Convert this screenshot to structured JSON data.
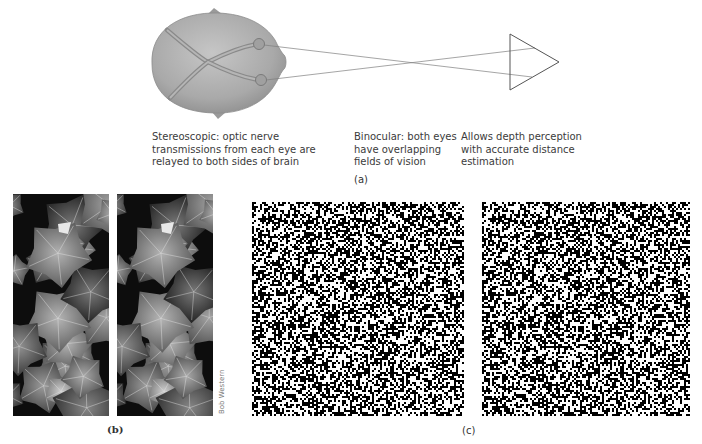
{
  "figure": {
    "panel_a": {
      "label": "(a)",
      "captions": {
        "stereoscopic": [
          "Stereoscopic: optic nerve",
          "transmissions from each eye are",
          "relayed to both sides of brain"
        ],
        "binocular": [
          "Binocular: both eyes",
          "have overlapping",
          "fields of vision"
        ],
        "depth": [
          "Allows depth perception",
          "with accurate distance",
          "estimation"
        ]
      },
      "elements": {
        "head": "top-view-head-with-crossing-optic-nerves",
        "object": "triangle"
      },
      "colors": {
        "head_fill": "#a8a8a8",
        "nerve": "#8a8a8a",
        "lines": "#888888"
      }
    },
    "panel_b": {
      "label": "(b)",
      "description": "Stereo pair photographs of leaves",
      "credit": "Bob Western"
    },
    "panel_c": {
      "label": "(c)",
      "description": "Random-dot stereogram pair"
    }
  }
}
